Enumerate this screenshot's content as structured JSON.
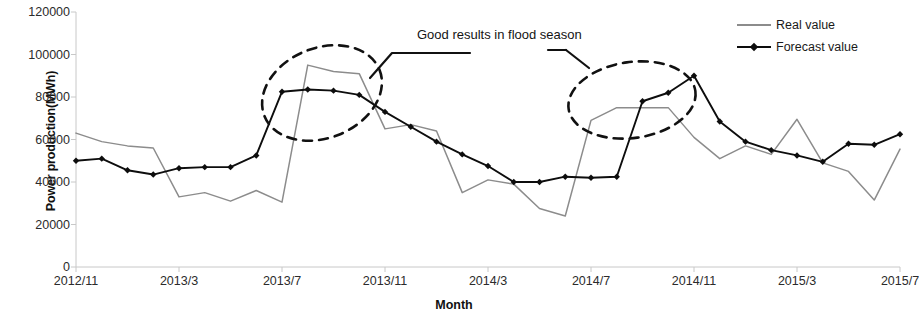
{
  "chart_data": {
    "type": "line",
    "title": "",
    "xlabel": "Month",
    "ylabel": "Power production(MWh)",
    "ylim": [
      0,
      120000
    ],
    "ytick_labels": [
      "0",
      "20000",
      "40000",
      "60000",
      "80000",
      "100000",
      "120000"
    ],
    "ytick_values": [
      0,
      20000,
      40000,
      60000,
      80000,
      100000,
      120000
    ],
    "grid": false,
    "legend_position": "top-right",
    "x": [
      "2012/11",
      "2012/12",
      "2013/1",
      "2013/2",
      "2013/3",
      "2013/4",
      "2013/5",
      "2013/6",
      "2013/7",
      "2013/8",
      "2013/9",
      "2013/10",
      "2013/11",
      "2013/12",
      "2014/1",
      "2014/2",
      "2014/3",
      "2014/4",
      "2014/5",
      "2014/6",
      "2014/7",
      "2014/8",
      "2014/9",
      "2014/10",
      "2014/11",
      "2014/12",
      "2015/1",
      "2015/2",
      "2015/3",
      "2015/4",
      "2015/5",
      "2015/6",
      "2015/7"
    ],
    "xtick_labels": [
      "2012/11",
      "2013/3",
      "2013/7",
      "2013/11",
      "2014/3",
      "2014/7",
      "2014/11",
      "2015/3",
      "2015/7"
    ],
    "series": [
      {
        "name": "Real value",
        "color": "#8c8c8c",
        "marker": "none",
        "values": [
          63000,
          59000,
          57000,
          56000,
          33000,
          35000,
          31000,
          36000,
          30500,
          95000,
          92000,
          91000,
          65000,
          67000,
          64000,
          35000,
          41000,
          39000,
          27500,
          24000,
          69000,
          75000,
          75000,
          75000,
          61000,
          51000,
          57000,
          53000,
          69500,
          49000,
          45000,
          31500,
          55500
        ]
      },
      {
        "name": "Forecast value",
        "color": "#0d0d0d",
        "marker": "diamond",
        "values": [
          50000,
          51000,
          45500,
          43500,
          46500,
          47000,
          47000,
          52500,
          82500,
          83500,
          83000,
          81000,
          73000,
          66000,
          59000,
          53000,
          47500,
          40000,
          40000,
          42500,
          42000,
          42500,
          78000,
          82000,
          90000,
          68500,
          59000,
          55000,
          52500,
          49500,
          58000,
          57500,
          62500
        ]
      }
    ],
    "annotations": [
      {
        "text": "Good results in flood season",
        "targets": [
          "2013 flood-season peak",
          "2014 flood-season peak"
        ],
        "highlight_shape": "dashed-ellipse",
        "highlight_count": 2
      }
    ]
  },
  "axes": {
    "y_title": "Power production(MWh)",
    "x_title": "Month"
  },
  "legend": {
    "items": [
      {
        "label": "Real value",
        "marker": "line-plain"
      },
      {
        "label": "Forecast value",
        "marker": "line-diamond"
      }
    ]
  },
  "annotation": {
    "text": "Good results in flood season"
  },
  "colors": {
    "real": "#8c8c8c",
    "forecast": "#0d0d0d",
    "axis": "#c8c8c8",
    "text": "#2b2b2b"
  }
}
